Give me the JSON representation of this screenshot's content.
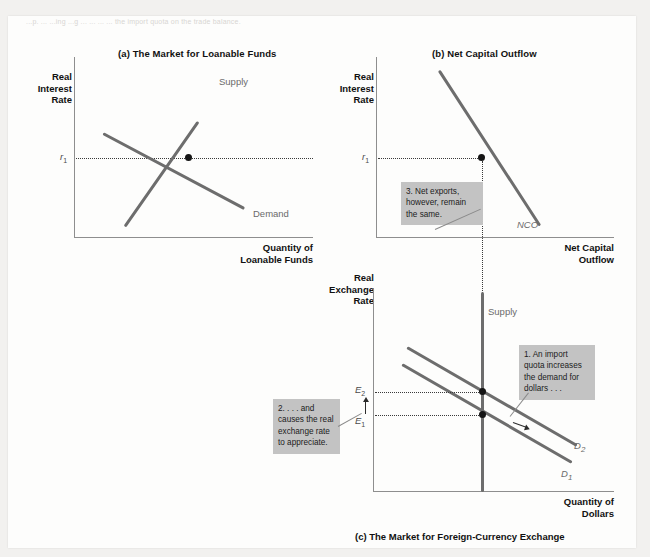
{
  "figure": {
    "top_text": "...p.  ...  ...ing  ...g   ...  ...   ...   ...  the import quota on the trade balance.",
    "bottom_caption": "(c) The Market for Foreign-Currency Exchange"
  },
  "panel_a": {
    "title": "(a) The Market for Loanable Funds",
    "y_axis_label": "Real\nInterest\nRate",
    "y_axis_line1": "Real",
    "y_axis_line2": "Interest",
    "y_axis_line3": "Rate",
    "x_axis_line1": "Quantity of",
    "x_axis_line2": "Loanable Funds",
    "supply_label": "Supply",
    "demand_label": "Demand",
    "equilibrium_tick": "r",
    "equilibrium_tick_sub": "1"
  },
  "panel_b": {
    "title": "(b) Net Capital Outflow",
    "y_axis_line1": "Real",
    "y_axis_line2": "Interest",
    "y_axis_line3": "Rate",
    "x_axis_line1": "Net Capital",
    "x_axis_line2": "Outflow",
    "curve_label": "NCO",
    "equilibrium_tick": "r",
    "equilibrium_tick_sub": "1",
    "callout": "3. Net exports, however, remain the same."
  },
  "panel_c": {
    "y_axis_line1": "Real",
    "y_axis_line2": "Exchange",
    "y_axis_line3": "Rate",
    "x_axis_line1": "Quantity of",
    "x_axis_line2": "Dollars",
    "supply_label": "Supply",
    "demand1_label": "D",
    "demand1_sub": "1",
    "demand2_label": "D",
    "demand2_sub": "2",
    "e1_label": "E",
    "e1_sub": "1",
    "e2_label": "E",
    "e2_sub": "2",
    "callout_right": "1. An import quota increases the demand for dollars . . .",
    "callout_left": "2. . . . and causes the real exchange rate to appreciate."
  },
  "colors": {
    "page_background": "#fdfdfc",
    "outer_background": "#f2f1ef",
    "curve": "#6d6d6d",
    "axis": "#8e8e8e",
    "callout_background": "#c3c3c3",
    "marker": "#151515"
  }
}
